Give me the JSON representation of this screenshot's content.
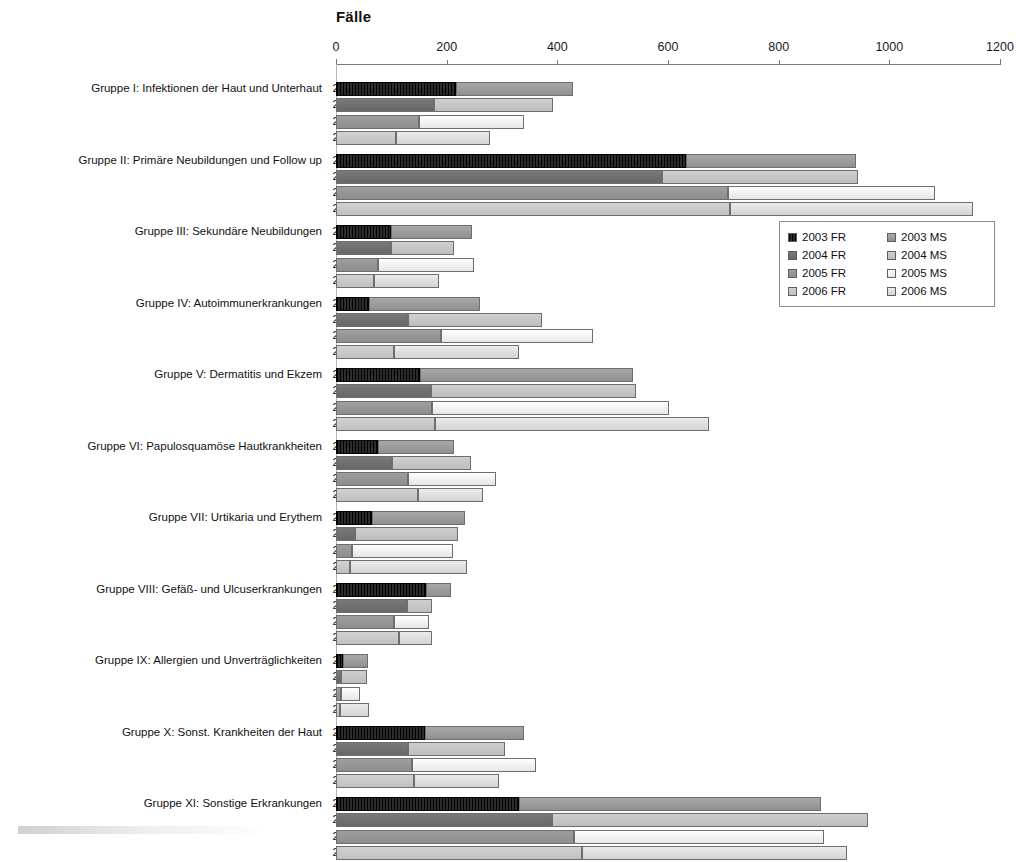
{
  "chart_data": {
    "type": "bar",
    "orientation": "horizontal",
    "stacked": true,
    "title": "Fälle",
    "xlabel": "",
    "ylabel": "",
    "xlim": [
      0,
      1200
    ],
    "xticks": [
      0,
      200,
      400,
      600,
      800,
      1000,
      1200
    ],
    "grid": false,
    "legend_position": "inside-right",
    "years": [
      "2003",
      "2004",
      "2005",
      "2006"
    ],
    "legend": [
      {
        "label": "2003 FR",
        "color": "#141414",
        "key": "fr03"
      },
      {
        "label": "2003 MS",
        "color": "#9a9a9a",
        "key": "ms03"
      },
      {
        "label": "2004 FR",
        "color": "#6e6e6e",
        "key": "fr04"
      },
      {
        "label": "2004 MS",
        "color": "#c3c3c3",
        "key": "ms04"
      },
      {
        "label": "2005 FR",
        "color": "#959595",
        "key": "fr05"
      },
      {
        "label": "2005 MS",
        "color": "#f0f0f0",
        "key": "ms05"
      },
      {
        "label": "2006 FR",
        "color": "#c8c8c8",
        "key": "fr06"
      },
      {
        "label": "2006 MS",
        "color": "#dedede",
        "key": "ms06"
      }
    ],
    "series": [
      {
        "name": "FR",
        "description": "Frauen"
      },
      {
        "name": "MS",
        "description": "Männer / Summe"
      }
    ],
    "categories": [
      "Gruppe I: Infektionen der Haut und Unterhaut",
      "Gruppe II: Primäre Neubildungen und Follow up",
      "Gruppe III: Sekundäre Neubildungen",
      "Gruppe IV: Autoimmunerkrankungen",
      "Gruppe V: Dermatitis und Ekzem",
      "Gruppe VI: Papulosquamöse Hautkrankheiten",
      "Gruppe VII: Urtikaria und Erythem",
      "Gruppe VIII: Gefäß- und Ulcuserkrankungen",
      "Gruppe IX: Allergien und Unverträglichkeiten",
      "Gruppe X: Sonst. Krankheiten der Haut",
      "Gruppe XI: Sonstige Erkrankungen"
    ],
    "groups": [
      {
        "label": "Gruppe I: Infektionen der Haut und Unterhaut",
        "rows": [
          {
            "year": "2003",
            "fr": 217,
            "ms": 212,
            "total": 429
          },
          {
            "year": "2004",
            "fr": 178,
            "ms": 215,
            "total": 393
          },
          {
            "year": "2005",
            "fr": 150,
            "ms": 190,
            "total": 340
          },
          {
            "year": "2006",
            "fr": 108,
            "ms": 170,
            "total": 278
          }
        ]
      },
      {
        "label": "Gruppe II: Primäre Neubildungen und Follow up",
        "rows": [
          {
            "year": "2003",
            "fr": 632,
            "ms": 308,
            "total": 940
          },
          {
            "year": "2004",
            "fr": 590,
            "ms": 354,
            "total": 944
          },
          {
            "year": "2005",
            "fr": 708,
            "ms": 375,
            "total": 1083
          },
          {
            "year": "2006",
            "fr": 712,
            "ms": 440,
            "total": 1152
          }
        ]
      },
      {
        "label": "Gruppe III: Sekundäre Neubildungen",
        "rows": [
          {
            "year": "2003",
            "fr": 100,
            "ms": 146,
            "total": 246
          },
          {
            "year": "2004",
            "fr": 100,
            "ms": 114,
            "total": 214
          },
          {
            "year": "2005",
            "fr": 76,
            "ms": 174,
            "total": 250
          },
          {
            "year": "2006",
            "fr": 69,
            "ms": 118,
            "total": 187
          }
        ]
      },
      {
        "label": "Gruppe IV: Autoimmunerkrankungen",
        "rows": [
          {
            "year": "2003",
            "fr": 60,
            "ms": 201,
            "total": 261
          },
          {
            "year": "2004",
            "fr": 131,
            "ms": 242,
            "total": 373
          },
          {
            "year": "2005",
            "fr": 190,
            "ms": 274,
            "total": 464
          },
          {
            "year": "2006",
            "fr": 104,
            "ms": 226,
            "total": 330
          }
        ]
      },
      {
        "label": "Gruppe V: Dermatitis und Ekzem",
        "rows": [
          {
            "year": "2003",
            "fr": 152,
            "ms": 384,
            "total": 536
          },
          {
            "year": "2004",
            "fr": 172,
            "ms": 371,
            "total": 543
          },
          {
            "year": "2005",
            "fr": 174,
            "ms": 427,
            "total": 601
          },
          {
            "year": "2006",
            "fr": 179,
            "ms": 496,
            "total": 675
          }
        ]
      },
      {
        "label": "Gruppe VI: Papulosquamöse Hautkrankheiten",
        "rows": [
          {
            "year": "2003",
            "fr": 75,
            "ms": 139,
            "total": 214
          },
          {
            "year": "2004",
            "fr": 102,
            "ms": 142,
            "total": 244
          },
          {
            "year": "2005",
            "fr": 131,
            "ms": 159,
            "total": 290
          },
          {
            "year": "2006",
            "fr": 149,
            "ms": 116,
            "total": 265
          }
        ]
      },
      {
        "label": "Gruppe VII: Urtikaria und Erythem",
        "rows": [
          {
            "year": "2003",
            "fr": 65,
            "ms": 169,
            "total": 234
          },
          {
            "year": "2004",
            "fr": 34,
            "ms": 186,
            "total": 220
          },
          {
            "year": "2005",
            "fr": 29,
            "ms": 183,
            "total": 212
          },
          {
            "year": "2006",
            "fr": 25,
            "ms": 211,
            "total": 236
          }
        ]
      },
      {
        "label": "Gruppe VIII: Gefäß- und Ulcuserkrankungen",
        "rows": [
          {
            "year": "2003",
            "fr": 163,
            "ms": 45,
            "total": 208
          },
          {
            "year": "2004",
            "fr": 129,
            "ms": 45,
            "total": 174
          },
          {
            "year": "2005",
            "fr": 105,
            "ms": 63,
            "total": 168
          },
          {
            "year": "2006",
            "fr": 114,
            "ms": 60,
            "total": 174
          }
        ]
      },
      {
        "label": "Gruppe IX: Allergien und Unverträglichkeiten",
        "rows": [
          {
            "year": "2003",
            "fr": 13,
            "ms": 44,
            "total": 57
          },
          {
            "year": "2004",
            "fr": 9,
            "ms": 47,
            "total": 56
          },
          {
            "year": "2005",
            "fr": 9,
            "ms": 34,
            "total": 43
          },
          {
            "year": "2006",
            "fr": 8,
            "ms": 52,
            "total": 60
          }
        ]
      },
      {
        "label": "Gruppe X: Sonst. Krankheiten der Haut",
        "rows": [
          {
            "year": "2003",
            "fr": 161,
            "ms": 179,
            "total": 340
          },
          {
            "year": "2004",
            "fr": 131,
            "ms": 175,
            "total": 306
          },
          {
            "year": "2005",
            "fr": 138,
            "ms": 224,
            "total": 362
          },
          {
            "year": "2006",
            "fr": 141,
            "ms": 153,
            "total": 294
          }
        ]
      },
      {
        "label": "Gruppe XI: Sonstige Erkrankungen",
        "rows": [
          {
            "year": "2003",
            "fr": 331,
            "ms": 546,
            "total": 877
          },
          {
            "year": "2004",
            "fr": 390,
            "ms": 572,
            "total": 962
          },
          {
            "year": "2005",
            "fr": 430,
            "ms": 452,
            "total": 882
          },
          {
            "year": "2006",
            "fr": 445,
            "ms": 479,
            "total": 924
          }
        ]
      }
    ]
  }
}
